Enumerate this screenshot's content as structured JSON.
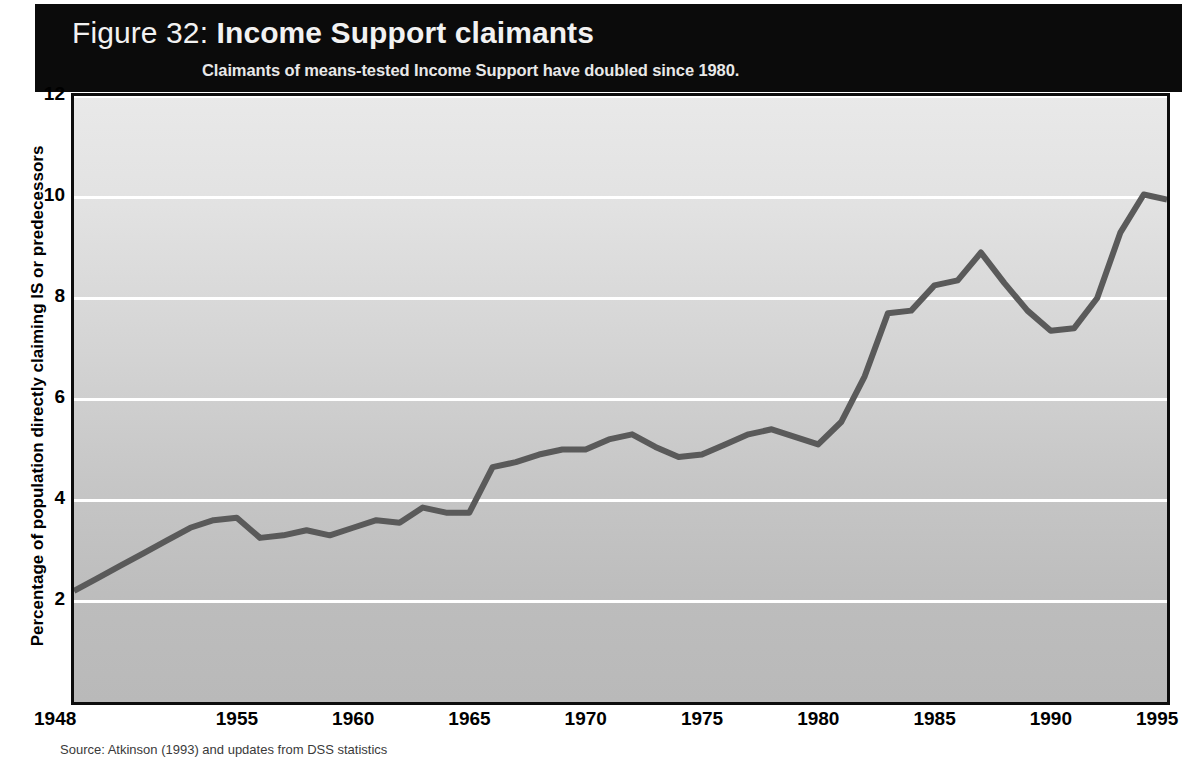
{
  "figure": {
    "number_label": "Figure 32:",
    "title": "Income Support claimants",
    "subtitle": "Claimants of means-tested Income Support have doubled since 1980.",
    "source_note": "Source: Atkinson (1993) and updates from DSS statistics",
    "banner_color": "#0b0b0b",
    "line_color": "#5a5a5a"
  },
  "axes": {
    "y_title": "Percentage of population directly claiming IS or predecessors",
    "y_ticks": [
      "2",
      "4",
      "6",
      "8",
      "10",
      "12"
    ],
    "x_ticks": [
      "1948",
      "1955",
      "1960",
      "1965",
      "1970",
      "1975",
      "1980",
      "1985",
      "1990",
      "1995"
    ]
  },
  "chart_data": {
    "type": "line",
    "title": "Income Support claimants",
    "subtitle": "Claimants of means-tested Income Support have doubled since 1980.",
    "xlabel": "",
    "ylabel": "Percentage of population directly claiming IS or predecessors",
    "xlim": [
      1948,
      1995
    ],
    "ylim": [
      0,
      12
    ],
    "yticks": [
      2,
      4,
      6,
      8,
      10,
      12
    ],
    "xticks": [
      1948,
      1955,
      1960,
      1965,
      1970,
      1975,
      1980,
      1985,
      1990,
      1995
    ],
    "grid": "horizontal-white",
    "legend": "none",
    "series": [
      {
        "name": "Percentage of population directly claiming IS or predecessors",
        "color": "#5a5a5a",
        "x": [
          1948,
          1949,
          1950,
          1951,
          1952,
          1953,
          1954,
          1955,
          1956,
          1957,
          1958,
          1959,
          1960,
          1961,
          1962,
          1963,
          1964,
          1965,
          1966,
          1967,
          1968,
          1969,
          1970,
          1971,
          1972,
          1973,
          1974,
          1975,
          1976,
          1977,
          1978,
          1979,
          1980,
          1981,
          1982,
          1983,
          1984,
          1985,
          1986,
          1987,
          1988,
          1989,
          1990,
          1991,
          1992,
          1993,
          1994,
          1995
        ],
        "values": [
          2.2,
          2.45,
          2.7,
          2.95,
          3.2,
          3.45,
          3.6,
          3.65,
          3.25,
          3.3,
          3.4,
          3.3,
          3.45,
          3.6,
          3.55,
          3.85,
          3.75,
          3.75,
          4.65,
          4.75,
          4.9,
          5.0,
          5.0,
          5.2,
          5.3,
          5.05,
          4.85,
          4.9,
          5.1,
          5.3,
          5.4,
          5.25,
          5.1,
          5.55,
          6.45,
          7.7,
          7.75,
          8.25,
          8.35,
          8.9,
          8.3,
          7.75,
          7.35,
          7.4,
          8.0,
          9.3,
          10.05,
          9.95
        ]
      }
    ]
  }
}
